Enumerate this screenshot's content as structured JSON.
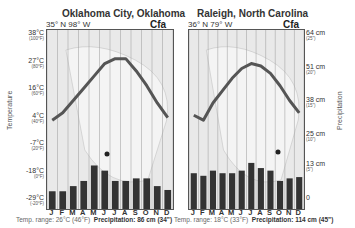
{
  "chart_data": [
    {
      "type": "bar+line",
      "title": "Oklahoma City, Oklahoma",
      "coordinates": "35° N  98° W",
      "climate_class": "Cfa",
      "categories": [
        "J",
        "F",
        "M",
        "A",
        "M",
        "J",
        "J",
        "A",
        "S",
        "O",
        "N",
        "D"
      ],
      "series": [
        {
          "name": "Temperature (°C)",
          "type": "line",
          "values": [
            3,
            6,
            11,
            16,
            21,
            26,
            28,
            28,
            23,
            17,
            10,
            4
          ]
        },
        {
          "name": "Precipitation (cm)",
          "type": "bar",
          "values": [
            3,
            3,
            5,
            7,
            13,
            11,
            7,
            7,
            8,
            8,
            5,
            3.5
          ]
        }
      ],
      "ylabel_left": "Temperature",
      "ylabel_right": "Precipitation",
      "temp_ticks": [
        "38°C",
        "27°C",
        "16°C",
        "4°C",
        "-7°C",
        "-18°C",
        "-29°C"
      ],
      "temp_ticks_f": [
        "(100°F)",
        "(80°F)",
        "(60°F)",
        "(40°F)",
        "(20°F)",
        "(0°F)",
        "(-20°F)"
      ],
      "ylim_temp": [
        -29,
        38
      ],
      "ylim_precip": [
        0,
        64
      ],
      "temp_range": "Temp. range: 26°C (46°F)",
      "precipitation_total": "Precipitation: 86 cm (34\")"
    },
    {
      "type": "bar+line",
      "title": "Raleigh, North Carolina",
      "coordinates": "36° N  79° W",
      "climate_class": "Cfa",
      "categories": [
        "J",
        "F",
        "M",
        "A",
        "M",
        "J",
        "J",
        "A",
        "S",
        "O",
        "N",
        "D"
      ],
      "series": [
        {
          "name": "Temperature (°C)",
          "type": "line",
          "values": [
            5,
            3,
            10,
            15,
            20,
            24,
            26,
            25,
            22,
            17,
            11,
            6
          ]
        },
        {
          "name": "Precipitation (cm)",
          "type": "bar",
          "values": [
            10,
            9,
            11,
            10,
            10,
            11,
            14,
            12,
            11,
            7,
            8,
            8.5
          ]
        }
      ],
      "ylabel_left": "Temperature",
      "ylabel_right": "Precipitation",
      "precip_ticks": [
        "64 cm",
        "51 cm",
        "38 cm",
        "25 cm",
        "13 cm",
        "0"
      ],
      "precip_ticks_in": [
        "(25\")",
        "(20\")",
        "(15\")",
        "(10\")",
        "(5\")",
        ""
      ],
      "ylim_temp": [
        -29,
        38
      ],
      "ylim_precip": [
        0,
        64
      ],
      "temp_range": "Temp. range: 18°C (33°F)",
      "precipitation_total": "Precipitation: 114 cm (45\")"
    }
  ],
  "left": {
    "title": "Oklahoma City, Oklahoma",
    "coords": "35° N  98° W",
    "cls": "Cfa",
    "temp_range": "Temp. range: 26°C (46°F)",
    "precip_label": "Precipitation: 86 cm (34\")"
  },
  "right": {
    "title": "Raleigh, North Carolina",
    "coords": "36° N  79° W",
    "cls": "Cfa",
    "temp_range": "Temp. range: 18°C (33°F)",
    "precip_label": "Precipitation: 114 cm (45\")"
  },
  "axes": {
    "temp_label": "Temperature",
    "precip_label": "Precipitation",
    "temp_ticks": [
      {
        "c": "38°C",
        "f": "(100°F)"
      },
      {
        "c": "27°C",
        "f": "(80°F)"
      },
      {
        "c": "16°C",
        "f": "(60°F)"
      },
      {
        "c": "4°C",
        "f": "(40°F)"
      },
      {
        "c": "-7°C",
        "f": "(20°F)"
      },
      {
        "c": "-18°C",
        "f": "(0°F)"
      },
      {
        "c": "-29°C",
        "f": "(-20°F)"
      }
    ],
    "precip_ticks": [
      {
        "cm": "64 cm",
        "in": "(25\")"
      },
      {
        "cm": "51 cm",
        "in": "(20\")"
      },
      {
        "cm": "38 cm",
        "in": "(15\")"
      },
      {
        "cm": "25 cm",
        "in": "(10\")"
      },
      {
        "cm": "13 cm",
        "in": "(5\")"
      },
      {
        "cm": "0",
        "in": ""
      }
    ],
    "months": [
      "J",
      "F",
      "M",
      "A",
      "M",
      "J",
      "J",
      "A",
      "S",
      "O",
      "N",
      "D"
    ]
  },
  "colors": {
    "line": "#555555",
    "bar": "#333333",
    "plot_bg": "#e9e9e9",
    "grid": "#999999"
  }
}
